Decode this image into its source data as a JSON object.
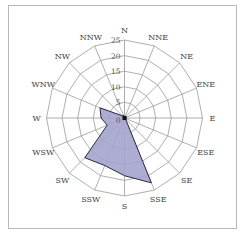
{
  "chart_data": {
    "type": "radar",
    "title": "",
    "categories": [
      "N",
      "NNE",
      "NE",
      "ENE",
      "E",
      "ESE",
      "SE",
      "SSE",
      "S",
      "SSW",
      "SW",
      "WSW",
      "W",
      "WNW",
      "NW",
      "NNW"
    ],
    "series": [
      {
        "name": "wind frequency",
        "values": [
          0.5,
          0.5,
          0.5,
          0.5,
          0.5,
          0.5,
          0.5,
          22.5,
          18.5,
          16.5,
          18,
          6,
          7.5,
          8.5,
          1,
          1
        ],
        "fill": "#a4a4cf",
        "stroke": "#2a2a3e"
      }
    ],
    "radial_ticks": [
      "0",
      "5",
      "10",
      "15",
      "20",
      "25"
    ],
    "rmax": 25,
    "grid": true,
    "grid_shape": "polygon",
    "legend": "none"
  },
  "colors": {
    "grid": "#9a9a9a",
    "frame": "#b8b8b8",
    "fill": "#a4a4cf",
    "stroke": "#2a2a3e"
  }
}
